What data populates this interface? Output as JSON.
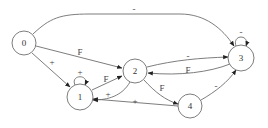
{
  "diagram": {
    "type": "state-transition-graph",
    "nodes": [
      {
        "id": "0",
        "label": "0",
        "x": 24,
        "y": 43
      },
      {
        "id": "1",
        "label": "1",
        "x": 80,
        "y": 97
      },
      {
        "id": "2",
        "label": "2",
        "x": 135,
        "y": 71
      },
      {
        "id": "3",
        "label": "3",
        "x": 241,
        "y": 58
      },
      {
        "id": "4",
        "label": "4",
        "x": 190,
        "y": 106
      }
    ],
    "edges": [
      {
        "from": "0",
        "to": "3",
        "label": "-"
      },
      {
        "from": "0",
        "to": "2",
        "label": "F"
      },
      {
        "from": "0",
        "to": "1",
        "label": "+"
      },
      {
        "from": "1",
        "to": "1",
        "label": "+"
      },
      {
        "from": "1",
        "to": "2",
        "label": "F"
      },
      {
        "from": "2",
        "to": "1",
        "label": "+"
      },
      {
        "from": "2",
        "to": "3",
        "label": "-"
      },
      {
        "from": "3",
        "to": "2",
        "label": "F"
      },
      {
        "from": "2",
        "to": "4",
        "label": "F"
      },
      {
        "from": "4",
        "to": "1",
        "label": "+"
      },
      {
        "from": "4",
        "to": "3",
        "label": "-"
      },
      {
        "from": "3",
        "to": "3",
        "label": "-"
      }
    ]
  }
}
